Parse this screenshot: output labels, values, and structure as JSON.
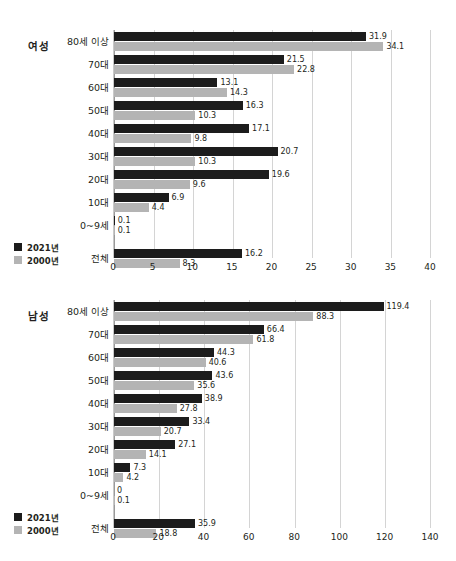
{
  "chart_data": [
    {
      "type": "bar",
      "orientation": "horizontal",
      "id": "female",
      "title": "여성",
      "categories": [
        "80세 이상",
        "70대",
        "60대",
        "50대",
        "40대",
        "30대",
        "20대",
        "10대",
        "0~9세",
        "전체"
      ],
      "series": [
        {
          "name": "2021년",
          "color": "#1c1c1c",
          "values": [
            31.9,
            21.5,
            13.1,
            16.3,
            17.1,
            20.7,
            19.6,
            6.9,
            0.1,
            16.2
          ],
          "labels": [
            "31.9",
            "21.5",
            "13.1",
            "16.3",
            "17.1",
            "20.7",
            "19.6",
            "6.9",
            "0.1",
            "16.2"
          ]
        },
        {
          "name": "2000년",
          "color": "#b4b4b4",
          "values": [
            34.1,
            22.8,
            14.3,
            10.3,
            9.8,
            10.3,
            9.6,
            4.4,
            0.1,
            8.3
          ],
          "labels": [
            "34.1",
            "22.8",
            "14.3",
            "10.3",
            "9.8",
            "10.3",
            "9.6",
            "4.4",
            "0.1",
            "8.3"
          ]
        }
      ],
      "xlabel": "",
      "ylabel": "",
      "xlim": [
        0,
        40
      ],
      "xticks": [
        0,
        5,
        10,
        15,
        20,
        25,
        30,
        35,
        40
      ],
      "xtick_labels": [
        "0",
        "5",
        "10",
        "15",
        "20",
        "25",
        "30",
        "35",
        "40"
      ],
      "grid": true,
      "legend_position": "bottom-left"
    },
    {
      "type": "bar",
      "orientation": "horizontal",
      "id": "male",
      "title": "남성",
      "categories": [
        "80세 이상",
        "70대",
        "60대",
        "50대",
        "40대",
        "30대",
        "20대",
        "10대",
        "0~9세",
        "전체"
      ],
      "series": [
        {
          "name": "2021년",
          "color": "#1c1c1c",
          "values": [
            119.4,
            66.4,
            44.3,
            43.6,
            38.9,
            33.4,
            27.1,
            7.3,
            0,
            35.9
          ],
          "labels": [
            "119.4",
            "66.4",
            "44.3",
            "43.6",
            "38.9",
            "33.4",
            "27.1",
            "7.3",
            "0",
            "35.9"
          ]
        },
        {
          "name": "2000년",
          "color": "#b4b4b4",
          "values": [
            88.3,
            61.8,
            40.6,
            35.6,
            27.8,
            20.7,
            14.1,
            4.2,
            0.1,
            18.8
          ],
          "labels": [
            "88.3",
            "61.8",
            "40.6",
            "35.6",
            "27.8",
            "20.7",
            "14.1",
            "4.2",
            "0.1",
            "18.8"
          ]
        }
      ],
      "xlabel": "",
      "ylabel": "",
      "xlim": [
        0,
        140
      ],
      "xticks": [
        0,
        20,
        40,
        60,
        80,
        100,
        120,
        140
      ],
      "xtick_labels": [
        "0",
        "20",
        "40",
        "60",
        "80",
        "100",
        "120",
        "140"
      ],
      "grid": true,
      "legend_position": "bottom-left"
    }
  ]
}
